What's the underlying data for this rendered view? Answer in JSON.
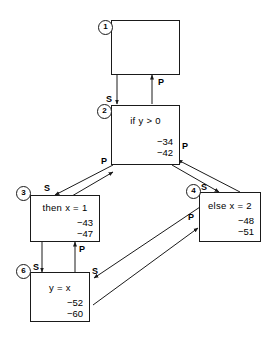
{
  "diagram": {
    "type": "flow-graph",
    "nodes": [
      {
        "id": "n1",
        "marker": "1",
        "text": "",
        "values": []
      },
      {
        "id": "n2",
        "marker": "2",
        "text": "if y > 0",
        "values": [
          "−34",
          "−42"
        ]
      },
      {
        "id": "n3",
        "marker": "3",
        "text": "then x = 1",
        "values": [
          "−43",
          "−47"
        ]
      },
      {
        "id": "n4",
        "marker": "4",
        "text": "else x = 2",
        "values": [
          "−48",
          "−51"
        ]
      },
      {
        "id": "n6",
        "marker": "6",
        "text": "y = x",
        "values": [
          "−52",
          "−60"
        ]
      }
    ],
    "edge_labels": {
      "n1_to_n2_s": "S",
      "n2_to_n1_p": "P",
      "n2_to_n3_s": "S",
      "n3_to_n2_p": "P",
      "n2_to_n4_s": "S",
      "n4_to_n2_p": "P",
      "n3_to_n6_s": "S",
      "n6_to_n3_p": "P",
      "n4_to_n6_s": "S",
      "n6_to_n4_p": "P"
    },
    "colors": {
      "stroke": "#1a1a1a",
      "background": "#ffffff"
    }
  }
}
